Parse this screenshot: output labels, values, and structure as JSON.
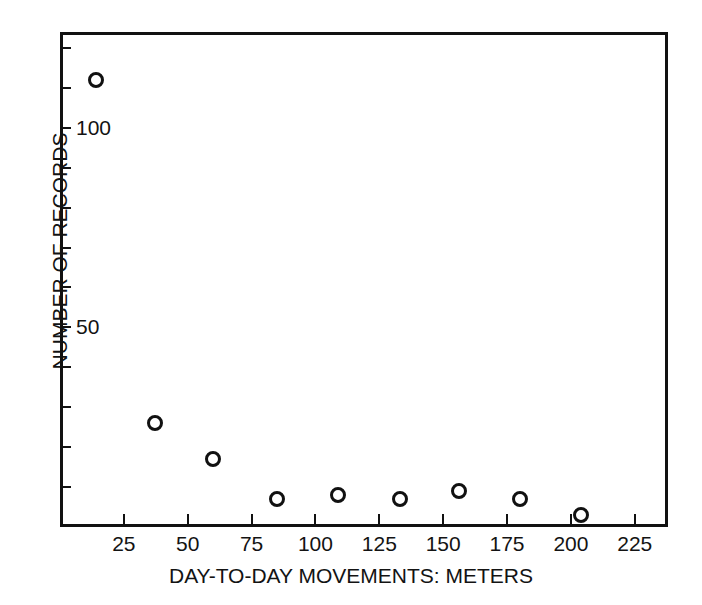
{
  "chart_data": {
    "type": "scatter",
    "title": "",
    "xlabel": "DAY-TO-DAY MOVEMENTS: METERS",
    "ylabel": "NUMBER OF RECORDS",
    "xlim": [
      0,
      238
    ],
    "ylim": [
      0,
      124
    ],
    "grid": false,
    "legend": null,
    "x_ticks": [
      25,
      50,
      75,
      100,
      125,
      150,
      175,
      200,
      225
    ],
    "x_tick_labels": [
      "25",
      "50",
      "75",
      "100",
      "125",
      "150",
      "175",
      "200",
      "225"
    ],
    "y_ticks": [
      10,
      20,
      30,
      40,
      50,
      60,
      70,
      80,
      90,
      100,
      110,
      120
    ],
    "y_tick_labels": [
      "",
      "",
      "",
      "",
      "50",
      "",
      "",
      "",
      "",
      "100",
      "",
      ""
    ],
    "y_labeled_ticks": [
      {
        "value": 50,
        "label": "50"
      },
      {
        "value": 100,
        "label": "100"
      }
    ],
    "marker": "open-circle",
    "marker_color": "#111111",
    "x": [
      14,
      37,
      60,
      85,
      109,
      133,
      156,
      180,
      204
    ],
    "y": [
      112,
      26,
      17,
      7,
      8,
      7,
      9,
      7,
      3
    ],
    "points": [
      {
        "x": 14,
        "y": 112
      },
      {
        "x": 37,
        "y": 26
      },
      {
        "x": 60,
        "y": 17
      },
      {
        "x": 85,
        "y": 7
      },
      {
        "x": 109,
        "y": 8
      },
      {
        "x": 133,
        "y": 7
      },
      {
        "x": 156,
        "y": 9
      },
      {
        "x": 180,
        "y": 7
      },
      {
        "x": 204,
        "y": 3
      }
    ]
  },
  "figure": {
    "background_color": "#ffffff",
    "axis_color": "#111111",
    "text_color": "#131313"
  }
}
